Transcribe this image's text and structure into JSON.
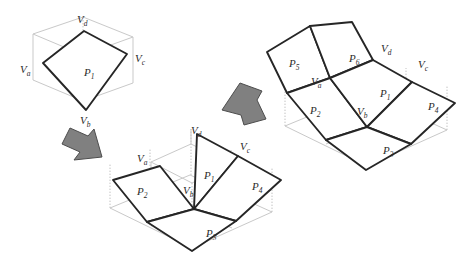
{
  "figure": {
    "colors": {
      "background": "#ffffff",
      "main_edge": "#262626",
      "guide_edge": "#c9c9c9",
      "dotted_guide": "#c2c2c2",
      "arrow_fill": "#808080",
      "arrow_stroke": "#4d4d4d",
      "label_text": "#2b2b2b"
    },
    "stages": [
      {
        "id": "stage-1",
        "name": "initial-single-patch",
        "labels": [
          {
            "base": "V",
            "sub": "d",
            "x": 85,
            "y": 19
          },
          {
            "base": "V",
            "sub": "c",
            "x": 134,
            "y": 59
          },
          {
            "base": "V",
            "sub": "a",
            "x": 24,
            "y": 70
          },
          {
            "base": "V",
            "sub": "b",
            "x": 86,
            "y": 119
          },
          {
            "base": "P",
            "sub": "1",
            "x": 89,
            "y": 72
          }
        ]
      },
      {
        "id": "stage-2",
        "name": "four-patch-split",
        "labels": [
          {
            "base": "V",
            "sub": "d",
            "x": 198,
            "y": 131
          },
          {
            "base": "V",
            "sub": "c",
            "x": 246,
            "y": 146
          },
          {
            "base": "V",
            "sub": "a",
            "x": 142,
            "y": 158
          },
          {
            "base": "V",
            "sub": "b",
            "x": 190,
            "y": 190
          },
          {
            "base": "P",
            "sub": "1",
            "x": 210,
            "y": 175
          },
          {
            "base": "P",
            "sub": "2",
            "x": 143,
            "y": 191
          },
          {
            "base": "P",
            "sub": "3",
            "x": 212,
            "y": 233
          },
          {
            "base": "P",
            "sub": "4",
            "x": 258,
            "y": 186
          }
        ]
      },
      {
        "id": "stage-3",
        "name": "six-patch-refined",
        "labels": [
          {
            "base": "V",
            "sub": "d",
            "x": 388,
            "y": 49
          },
          {
            "base": "V",
            "sub": "c",
            "x": 425,
            "y": 64
          },
          {
            "base": "V",
            "sub": "a",
            "x": 317,
            "y": 82
          },
          {
            "base": "V",
            "sub": "b",
            "x": 364,
            "y": 111
          },
          {
            "base": "P",
            "sub": "1",
            "x": 386,
            "y": 93
          },
          {
            "base": "P",
            "sub": "2",
            "x": 316,
            "y": 110
          },
          {
            "base": "P",
            "sub": "3",
            "x": 389,
            "y": 150
          },
          {
            "base": "P",
            "sub": "4",
            "x": 434,
            "y": 106
          },
          {
            "base": "P",
            "sub": "5",
            "x": 295,
            "y": 63
          },
          {
            "base": "P",
            "sub": "6",
            "x": 355,
            "y": 58
          }
        ]
      }
    ],
    "arrows": [
      {
        "id": "arrow-1",
        "name": "arrow-stage1-to-stage2",
        "direction": "down-right"
      },
      {
        "id": "arrow-2",
        "name": "arrow-stage2-to-stage3",
        "direction": "up-right"
      }
    ]
  }
}
